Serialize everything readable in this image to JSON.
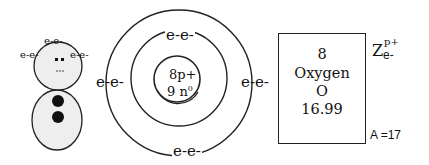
{
  "snowman": {
    "head_electrons_top": "e-e-",
    "head_electrons_left": "e-e-",
    "head_electrons_right": "e-e-",
    "eyes": "■■",
    "mouth": "...",
    "fill_color": "#eeeeee"
  },
  "bohr_model": {
    "nucleus_protons": "8p+",
    "nucleus_neutrons": "9 n",
    "neutron_superscript": "0",
    "electrons_top": "e-e-",
    "electrons_left": "e-e-",
    "electrons_right": "e-e-",
    "electrons_bottom": "e-e-"
  },
  "element_box": {
    "atomic_number": "8",
    "name": "Oxygen",
    "symbol": "O",
    "atomic_mass": "16.99"
  },
  "legend": {
    "z_label": "Z",
    "z_superscript": "p+",
    "z_subscript": "e-",
    "mass_number": "A =17"
  }
}
